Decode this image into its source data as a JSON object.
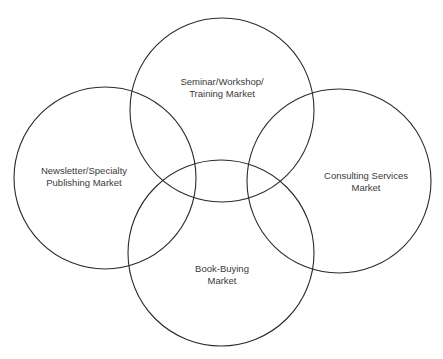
{
  "diagram": {
    "type": "venn",
    "sets": [
      {
        "id": "seminar",
        "lines": [
          "Seminar/Workshop/",
          "Training Market"
        ]
      },
      {
        "id": "newsletter",
        "lines": [
          "Newsletter/Specialty",
          "Publishing Market"
        ]
      },
      {
        "id": "consulting",
        "lines": [
          "Consulting Services",
          "Market"
        ]
      },
      {
        "id": "book",
        "lines": [
          "Book-Buying",
          "Market"
        ]
      }
    ],
    "colors": {
      "stroke": "#2a2a2a",
      "text": "#3a3a3a",
      "background": "#ffffff"
    }
  }
}
